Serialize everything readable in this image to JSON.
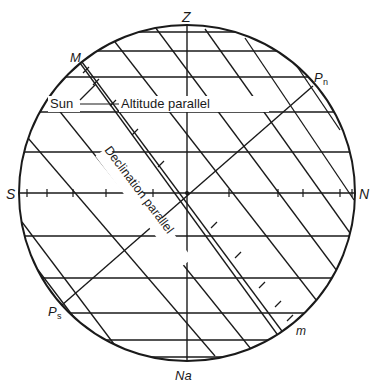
{
  "diagram": {
    "colors": {
      "line": "#1a1a1a",
      "background": "#ffffff"
    },
    "circle": {
      "cx": 187,
      "cy": 193,
      "r": 168
    },
    "axes": {
      "zenith_nadir": {
        "x1": 187,
        "y1": 25,
        "x2": 187,
        "y2": 361
      },
      "horizon": {
        "x1": 19,
        "y1": 193,
        "x2": 355,
        "y2": 193
      },
      "polar_axis": {
        "x1": 62,
        "y1": 305,
        "x2": 313,
        "y2": 86
      }
    },
    "altitude_parallels_y": [
      32,
      51,
      77,
      112,
      152,
      236,
      278,
      313,
      340,
      357
    ],
    "declination_parallels": [
      {
        "x1": 155,
        "y1": 27,
        "x2": 346,
        "y2": 283
      },
      {
        "x1": 115,
        "y1": 42,
        "x2": 324,
        "y2": 310
      },
      {
        "x1": 82,
        "y1": 62,
        "x2": 296,
        "y2": 350
      },
      {
        "x1": 57,
        "y1": 108,
        "x2": 259,
        "y2": 359
      },
      {
        "x1": 28,
        "y1": 138,
        "x2": 215,
        "y2": 356
      },
      {
        "x1": 22,
        "y1": 222,
        "x2": 126,
        "y2": 360
      },
      {
        "x1": 32,
        "y1": 262,
        "x2": 95,
        "y2": 345
      },
      {
        "x1": 205,
        "y1": 29,
        "x2": 350,
        "y2": 233
      },
      {
        "x1": 245,
        "y1": 38,
        "x2": 354,
        "y2": 200
      },
      {
        "x1": 290,
        "y1": 56,
        "x2": 340,
        "y2": 130
      }
    ],
    "meridian_line": {
      "x1": 80,
      "y1": 63,
      "x2": 293,
      "y2": 356
    },
    "meridian_ticks": [
      {
        "x": 86,
        "y": 70
      },
      {
        "x": 96,
        "y": 82
      },
      {
        "x": 113,
        "y": 103
      },
      {
        "x": 135,
        "y": 132
      },
      {
        "x": 161,
        "y": 164
      },
      {
        "x": 214,
        "y": 225
      },
      {
        "x": 238,
        "y": 255
      },
      {
        "x": 262,
        "y": 285
      },
      {
        "x": 278,
        "y": 304
      },
      {
        "x": 290,
        "y": 318
      }
    ],
    "horizon_ticks": [
      {
        "x": 27
      },
      {
        "x": 47
      },
      {
        "x": 73
      },
      {
        "x": 106
      },
      {
        "x": 153
      },
      {
        "x": 229
      },
      {
        "x": 278
      },
      {
        "x": 303
      },
      {
        "x": 340
      },
      {
        "x": 352
      }
    ],
    "labels": {
      "zenith": "Z",
      "nadir": "Na",
      "north": "N",
      "south": "S",
      "north_pole": "P",
      "north_pole_sub": "n",
      "south_pole": "P",
      "south_pole_sub": "s",
      "meridian_top": "M",
      "meridian_bottom": "m",
      "sun": "Sun",
      "altitude_parallel": "Altitude parallel",
      "declination_parallel": "Declination parallel"
    }
  }
}
